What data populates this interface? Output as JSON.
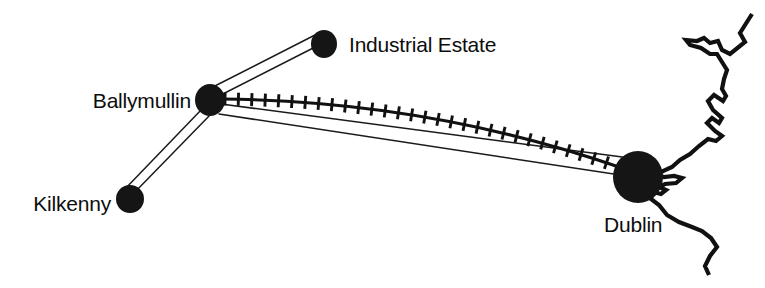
{
  "figure": {
    "kind": "schematic-transport-map",
    "background_color": "#ffffff",
    "ink_color": "#111111",
    "width": 765,
    "height": 288
  },
  "nodes": [
    {
      "id": "industrial-estate",
      "label": "Industrial Estate",
      "cx": 324,
      "cy": 44,
      "rx": 13,
      "ry": 14,
      "label_x": 349,
      "label_y": 52,
      "label_anchor": "start"
    },
    {
      "id": "ballymullin",
      "label": "Ballymullin",
      "cx": 210,
      "cy": 100,
      "rx": 15,
      "ry": 16,
      "label_x": 191,
      "label_y": 108,
      "label_anchor": "end"
    },
    {
      "id": "kilkenny",
      "label": "Kilkenny",
      "cx": 130,
      "cy": 199,
      "rx": 14,
      "ry": 14,
      "label_x": 111,
      "label_y": 211,
      "label_anchor": "end"
    },
    {
      "id": "dublin",
      "label": "Dublin",
      "cx": 638,
      "cy": 177,
      "rx": 25,
      "ry": 26,
      "label_x": 604,
      "label_y": 232,
      "label_anchor": "start"
    }
  ],
  "links": [
    {
      "id": "road-ballymullin-industrial-estate",
      "from": "ballymullin",
      "to": "industrial-estate",
      "type": "road",
      "style": "double-line"
    },
    {
      "id": "road-ballymullin-kilkenny",
      "from": "ballymullin",
      "to": "kilkenny",
      "type": "road",
      "style": "double-line"
    },
    {
      "id": "road-ballymullin-dublin",
      "from": "ballymullin",
      "to": "dublin",
      "type": "road",
      "style": "double-line"
    },
    {
      "id": "railway-ballymullin-dublin",
      "from": "ballymullin",
      "to": "dublin",
      "type": "railway",
      "style": "hatched-curve",
      "tick_count": 30
    }
  ],
  "coastline": {
    "id": "east-coast",
    "description": "irish-east-coastline-with-dublin-bay"
  },
  "caption_remnant": {
    "visible": false,
    "text": ""
  }
}
